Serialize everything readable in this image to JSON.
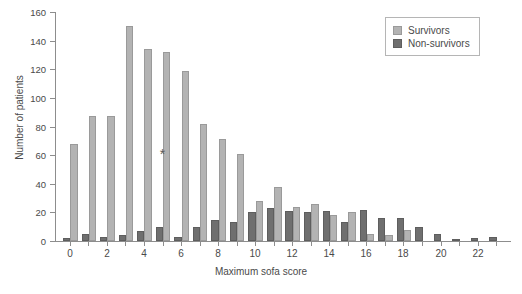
{
  "chart_data": {
    "type": "bar",
    "title": "",
    "xlabel": "Maximum sofa score",
    "ylabel": "Number of patients",
    "categories": [
      0,
      1,
      2,
      3,
      4,
      5,
      6,
      7,
      8,
      9,
      10,
      11,
      12,
      13,
      14,
      15,
      16,
      17,
      18,
      19,
      20,
      21,
      22,
      23
    ],
    "xlim": [
      -0.8,
      23.8
    ],
    "ylim": [
      0,
      160
    ],
    "yticks": [
      0,
      20,
      40,
      60,
      80,
      100,
      120,
      140,
      160
    ],
    "xticks_labeled": [
      0,
      2,
      4,
      6,
      8,
      10,
      12,
      14,
      16,
      18,
      20,
      22
    ],
    "grid": false,
    "legend_position": "top-right",
    "series": [
      {
        "name": "Non-survivors",
        "color": "#6f6f6f",
        "values": [
          2,
          5,
          3,
          4,
          7,
          10,
          3,
          10,
          15,
          13,
          20,
          23,
          21,
          20,
          21,
          13,
          22,
          16,
          16,
          10,
          5,
          1,
          2,
          3
        ]
      },
      {
        "name": "Survivors",
        "color": "#b3b3b3",
        "values": [
          68,
          87,
          87,
          150,
          134,
          132,
          119,
          82,
          71,
          61,
          28,
          38,
          24,
          26,
          18,
          20,
          5,
          4,
          8,
          0,
          0,
          0,
          0,
          0
        ]
      }
    ],
    "annotations": [
      {
        "text": "*",
        "x": 5,
        "y": 61
      }
    ]
  },
  "legend": {
    "items": [
      {
        "label": "Survivors",
        "color": "#b3b3b3"
      },
      {
        "label": "Non-survivors",
        "color": "#6f6f6f"
      }
    ]
  }
}
